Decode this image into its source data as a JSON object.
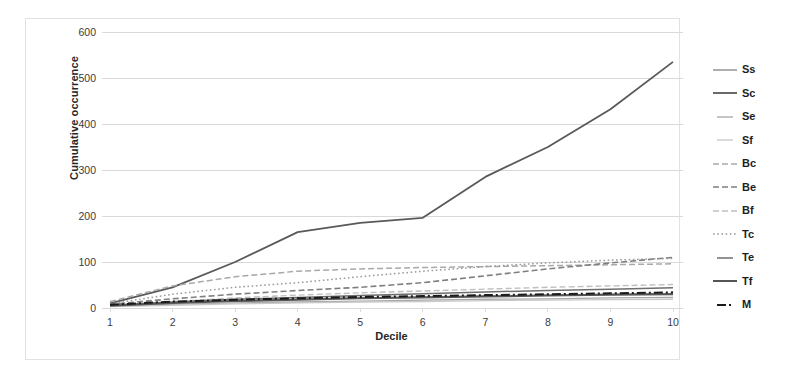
{
  "chart_data": {
    "type": "line",
    "title": "",
    "xlabel": "Decile",
    "ylabel": "Cumulative occurrence",
    "categories": [
      "1",
      "2",
      "3",
      "4",
      "5",
      "6",
      "7",
      "8",
      "9",
      "10"
    ],
    "x": [
      1,
      2,
      3,
      4,
      5,
      6,
      7,
      8,
      9,
      10
    ],
    "xlim": [
      1,
      10
    ],
    "ylim": [
      0,
      600
    ],
    "yticks": [
      0,
      100,
      200,
      300,
      400,
      500,
      600
    ],
    "ytick_labels": [
      "0",
      "100",
      "200",
      "300",
      "400",
      "500",
      "600"
    ],
    "grid": "horizontal",
    "legend_position": "right",
    "series": [
      {
        "name": "Ss",
        "color": "#8c8c8c",
        "dash": "solid",
        "width": 1.4,
        "values": [
          6,
          12,
          16,
          19,
          22,
          24,
          26,
          28,
          30,
          31
        ]
      },
      {
        "name": "Sc",
        "color": "#595959",
        "dash": "solid",
        "width": 1.8,
        "values": [
          10,
          45,
          100,
          165,
          185,
          196,
          285,
          350,
          432,
          535
        ]
      },
      {
        "name": "Se",
        "color": "#a6a6a6",
        "dash": "solid",
        "width": 1.3,
        "values": [
          4,
          8,
          11,
          13,
          15,
          17,
          19,
          20,
          22,
          23
        ]
      },
      {
        "name": "Sf",
        "color": "#c8c8c8",
        "dash": "solid",
        "width": 1.3,
        "values": [
          3,
          6,
          9,
          11,
          13,
          14,
          16,
          17,
          18,
          19
        ]
      },
      {
        "name": "Bc",
        "color": "#a9a9a9",
        "dash": "dashed",
        "width": 1.5,
        "values": [
          14,
          48,
          68,
          80,
          85,
          88,
          90,
          92,
          94,
          96
        ]
      },
      {
        "name": "Be",
        "color": "#7f7f7f",
        "dash": "dashed",
        "width": 1.6,
        "values": [
          8,
          20,
          30,
          38,
          45,
          55,
          70,
          85,
          98,
          110
        ]
      },
      {
        "name": "Bf",
        "color": "#bfbfbf",
        "dash": "dashed",
        "width": 1.4,
        "values": [
          5,
          14,
          22,
          28,
          33,
          37,
          41,
          45,
          48,
          51
        ]
      },
      {
        "name": "Tc",
        "color": "#9a9a9a",
        "dash": "dotted",
        "width": 1.5,
        "values": [
          9,
          30,
          45,
          55,
          68,
          80,
          90,
          98,
          104,
          108
        ]
      },
      {
        "name": "Te",
        "color": "#6e6e6e",
        "dash": "solid",
        "width": 1.5,
        "values": [
          6,
          13,
          19,
          23,
          27,
          31,
          35,
          38,
          41,
          44
        ]
      },
      {
        "name": "Tf",
        "color": "#555555",
        "dash": "solid",
        "width": 2.0,
        "values": [
          5,
          11,
          15,
          18,
          21,
          23,
          25,
          27,
          29,
          30
        ]
      },
      {
        "name": "M",
        "color": "#1a1a1a",
        "dash": "dashdot",
        "width": 2.0,
        "values": [
          7,
          14,
          18,
          21,
          24,
          26,
          28,
          30,
          32,
          34
        ]
      }
    ]
  },
  "axis": {
    "y_title": "Cumulative occurrence",
    "x_title": "Decile"
  },
  "legend": {
    "items": [
      {
        "label": "Ss"
      },
      {
        "label": "Sc"
      },
      {
        "label": "Se"
      },
      {
        "label": "Sf"
      },
      {
        "label": "Bc"
      },
      {
        "label": "Be"
      },
      {
        "label": "Bf"
      },
      {
        "label": "Tc"
      },
      {
        "label": "Te"
      },
      {
        "label": "Tf"
      },
      {
        "label": "M"
      }
    ]
  },
  "colors": {
    "background": "#ffffff",
    "frame": "#e2e2e2",
    "gridline": "#d9d9d9",
    "axis_text": "#3b3b3b"
  }
}
